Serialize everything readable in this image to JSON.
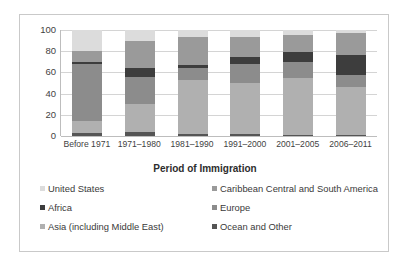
{
  "chart_data": {
    "type": "bar",
    "stacked": true,
    "title": "",
    "xlabel": "Period of Immigration",
    "ylabel": "",
    "ylim": [
      0,
      100
    ],
    "yticks": [
      0,
      20,
      40,
      60,
      80,
      100
    ],
    "grid": true,
    "legend_position": "bottom",
    "categories": [
      "Before 1971",
      "1971–1980",
      "1981–1990",
      "1991–2000",
      "2001–2005",
      "2006–2011"
    ],
    "series": [
      {
        "name": "Ocean and Other",
        "color": "#555555",
        "values": [
          3,
          4,
          2,
          2,
          1,
          1
        ]
      },
      {
        "name": "Asia (including Middle East)",
        "color": "#b0b0b0",
        "values": [
          11,
          26,
          51,
          48,
          54,
          45
        ]
      },
      {
        "name": "Europe",
        "color": "#8c8c8c",
        "values": [
          54,
          26,
          11,
          18,
          15,
          12
        ]
      },
      {
        "name": "Africa",
        "color": "#3d3d3d",
        "values": [
          2,
          8,
          3,
          7,
          9,
          18
        ]
      },
      {
        "name": "Caribbean Central and South America",
        "color": "#9a9a9a",
        "values": [
          10,
          26,
          26,
          18,
          16,
          21
        ]
      },
      {
        "name": "United States",
        "color": "#dcdcdc",
        "values": [
          20,
          10,
          7,
          7,
          5,
          3
        ]
      }
    ],
    "bar_totals": [
      100,
      100,
      100,
      100,
      100,
      100
    ]
  },
  "axis": {
    "y_ticks": [
      "100",
      "80",
      "60",
      "40",
      "20",
      "0"
    ],
    "x_title": "Period of Immigration",
    "x_tick_labels": [
      "Before 1971",
      "1971–1980",
      "1981–1990",
      "1991–2000",
      "2001–2005",
      "2006–2011"
    ]
  },
  "legend": {
    "items": [
      {
        "label": "United States",
        "color": "#dcdcdc"
      },
      {
        "label": "Caribbean Central and South America",
        "color": "#9a9a9a"
      },
      {
        "label": "Africa",
        "color": "#3d3d3d"
      },
      {
        "label": "Europe",
        "color": "#8c8c8c"
      },
      {
        "label": "Asia (including Middle East)",
        "color": "#b0b0b0"
      },
      {
        "label": "Ocean and Other",
        "color": "#555555"
      }
    ]
  },
  "style": {
    "frame_border": "#c9c9c9",
    "gridline": "#d4d4d4",
    "axis_line": "#bdbdbd",
    "background": "#ffffff",
    "text": "#3a3a3a"
  }
}
